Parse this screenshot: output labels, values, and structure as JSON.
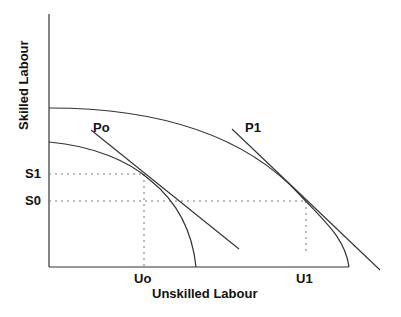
{
  "diagram": {
    "type": "production-possibility-frontier",
    "axes": {
      "x_label": "Unskilled Labour",
      "y_label": "Skilled Labour"
    },
    "curves": [
      {
        "name": "inner-ppf",
        "label": "Po"
      },
      {
        "name": "outer-ppf",
        "label": "P1"
      }
    ],
    "tick_labels": {
      "y": [
        "S1",
        "S0"
      ],
      "x": [
        "Uo",
        "U1"
      ]
    },
    "labels": {
      "po": "Po",
      "p1": "P1",
      "s1": "S1",
      "s0": "S0",
      "uo": "Uo",
      "u1": "U1"
    },
    "colors": {
      "line": "#333333",
      "dotted": "#777777",
      "text": "#111111"
    }
  }
}
